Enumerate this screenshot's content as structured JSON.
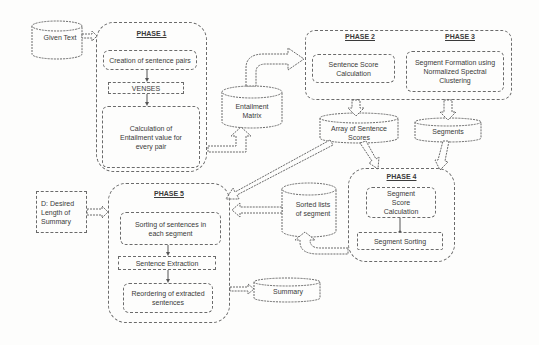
{
  "diagram": {
    "inputs": {
      "given_text": "Given Text",
      "desired_length": "D: Desired Length of Summary"
    },
    "phase1": {
      "title": "PHASE 1",
      "steps": [
        "Creation of sentence pairs",
        "VENSES",
        "Calculation of Entailment value for every pair"
      ]
    },
    "entailment_matrix": "Entailment Matrix",
    "phase2": {
      "title": "PHASE 2",
      "step": "Sentence Score Calculation"
    },
    "phase3": {
      "title": "PHASE 3",
      "step": "Segment Formation using Normalized Spectral Clustering"
    },
    "array_scores": "Array of Sentence Scores",
    "segments": "Segments",
    "phase4": {
      "title": "PHASE 4",
      "steps": [
        "Segment Score Calculation",
        "Segment Sorting"
      ]
    },
    "sorted_lists": "Sorted lists of segment",
    "phase5": {
      "title": "PHASE 5",
      "steps": [
        "Sorting of sentences in each segment",
        "Sentence Extraction",
        "Reordering of extracted sentences"
      ]
    },
    "summary": "Summary"
  },
  "colors": {
    "stroke": "#6a6a6a",
    "text": "#3a3a3a",
    "background": "#fdfdfc"
  }
}
